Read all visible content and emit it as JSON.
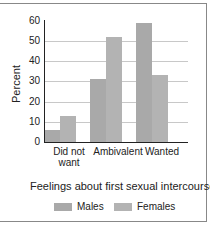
{
  "chart_data": {
    "type": "bar",
    "title": "",
    "xlabel": "Feelings about first sexual intercourse",
    "ylabel": "Percent",
    "ylim": [
      0,
      60
    ],
    "yticks": [
      0,
      10,
      20,
      30,
      40,
      50,
      60
    ],
    "grid": true,
    "legend_position": "bottom",
    "categories": [
      "Did not want",
      "Ambivalent",
      "Wanted"
    ],
    "series": [
      {
        "name": "Males",
        "values": [
          6,
          31,
          59
        ],
        "color": "#a9a9a9"
      },
      {
        "name": "Females",
        "values": [
          13,
          52,
          33
        ],
        "color": "#b3b3b3"
      }
    ]
  },
  "labels": {
    "y_ticks": [
      "0",
      "10",
      "20",
      "30",
      "40",
      "50",
      "60"
    ],
    "ylabel": "Percent",
    "cat_0_line1": "Did not",
    "cat_0_line2": "want",
    "cat_1": "Ambivalent",
    "cat_2": "Wanted",
    "xlabel": "Feelings about first sexual intercourse",
    "legend_males": "Males",
    "legend_females": "Females"
  }
}
